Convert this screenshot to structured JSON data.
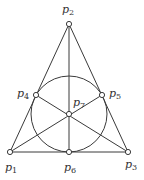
{
  "diagram": {
    "stroke_color": "#3a3a3a",
    "points": [
      {
        "id": "p1",
        "label": "p",
        "sub": "1",
        "x": 10,
        "y": 152,
        "lx": 5,
        "ly": 171
      },
      {
        "id": "p2",
        "label": "p",
        "sub": "2",
        "x": 69,
        "y": 24,
        "lx": 62,
        "ly": 13
      },
      {
        "id": "p3",
        "label": "p",
        "sub": "3",
        "x": 128,
        "y": 152,
        "lx": 125,
        "ly": 168
      },
      {
        "id": "p4",
        "label": "p",
        "sub": "4",
        "x": 36,
        "y": 95,
        "lx": 17,
        "ly": 97
      },
      {
        "id": "p5",
        "label": "p",
        "sub": "5",
        "x": 102,
        "y": 95,
        "lx": 109,
        "ly": 97
      },
      {
        "id": "p6",
        "label": "p",
        "sub": "6",
        "x": 69,
        "y": 152,
        "lx": 64,
        "ly": 171
      },
      {
        "id": "p7",
        "label": "p",
        "sub": "7",
        "x": 69,
        "y": 114,
        "lx": 73,
        "ly": 106
      }
    ],
    "lines": [
      [
        "p1",
        "p2"
      ],
      [
        "p2",
        "p3"
      ],
      [
        "p1",
        "p3"
      ],
      [
        "p2",
        "p6"
      ],
      [
        "p1",
        "p5"
      ],
      [
        "p3",
        "p4"
      ]
    ],
    "circle": {
      "cx": 69,
      "cy": 114,
      "r": 38
    }
  }
}
